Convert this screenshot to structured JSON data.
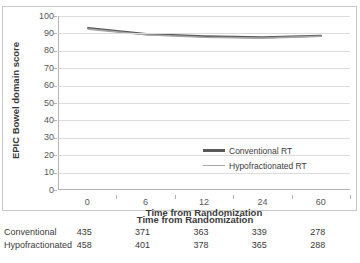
{
  "chart_data": {
    "type": "line",
    "title": "",
    "xlabel": "Time from Randomization",
    "ylabel": "EPIC Bowel domain score",
    "x": [
      0,
      6,
      12,
      24,
      60
    ],
    "xtick_labels": [
      "0",
      "6",
      "12",
      "24",
      "60"
    ],
    "ylim": [
      0,
      100
    ],
    "ytick_labels": [
      "0",
      "10",
      "20",
      "30",
      "40",
      "50",
      "60",
      "70",
      "80",
      "90",
      "100"
    ],
    "yticks": [
      0,
      10,
      20,
      30,
      40,
      50,
      60,
      70,
      80,
      90,
      100
    ],
    "grid": true,
    "legend_position": "center-right",
    "series": [
      {
        "name": "Conventional RT",
        "values": [
          93,
          89.5,
          88.2,
          87.6,
          88.6
        ],
        "color": "#595959"
      },
      {
        "name": "Hypofractionated RT",
        "values": [
          92.4,
          89.2,
          87.7,
          87.2,
          88.3
        ],
        "color": "#a6a6a6"
      }
    ],
    "at_risk_table": {
      "title": "Time from Randomization",
      "rows": [
        {
          "label": "Conventional",
          "counts": [
            "435",
            "371",
            "363",
            "339",
            "278"
          ]
        },
        {
          "label": "Hypofractionated",
          "counts": [
            "458",
            "401",
            "378",
            "365",
            "288"
          ]
        }
      ]
    }
  }
}
